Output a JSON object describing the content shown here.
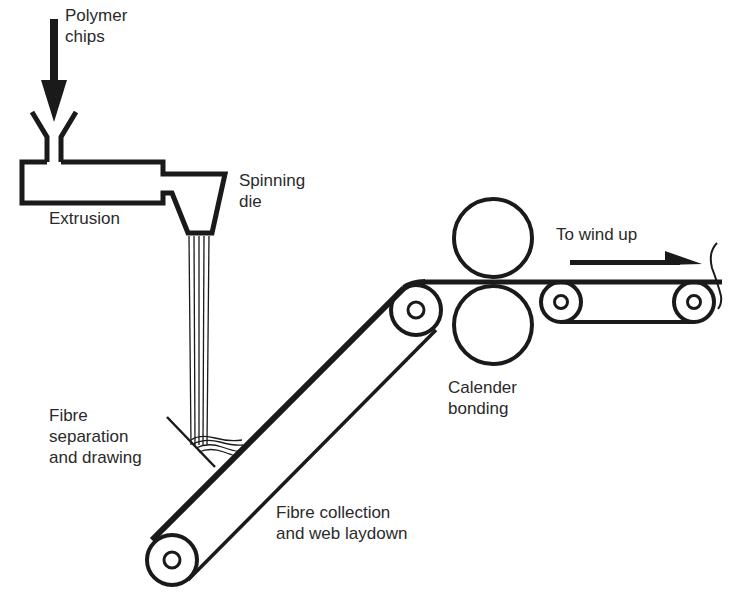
{
  "diagram": {
    "type": "process-flow",
    "colors": {
      "stroke": "#1a1a1a",
      "text": "#2a2a2a",
      "background": "#ffffff"
    },
    "labels": {
      "polymer_chips_line1": "Polymer",
      "polymer_chips_line2": "chips",
      "extrusion": "Extrusion",
      "spinning_die_line1": "Spinning",
      "spinning_die_line2": "die",
      "fibre_separation_line1": "Fibre",
      "fibre_separation_line2": "separation",
      "fibre_separation_line3": "and drawing",
      "fibre_collection_line1": "Fibre collection",
      "fibre_collection_line2": "and web laydown",
      "calender_line1": "Calender",
      "calender_line2": "bonding",
      "to_wind_up": "To wind up"
    },
    "stages": [
      "Polymer chips",
      "Extrusion",
      "Spinning die",
      "Fibre separation and drawing",
      "Fibre collection and web laydown",
      "Calender bonding",
      "To wind up"
    ]
  }
}
